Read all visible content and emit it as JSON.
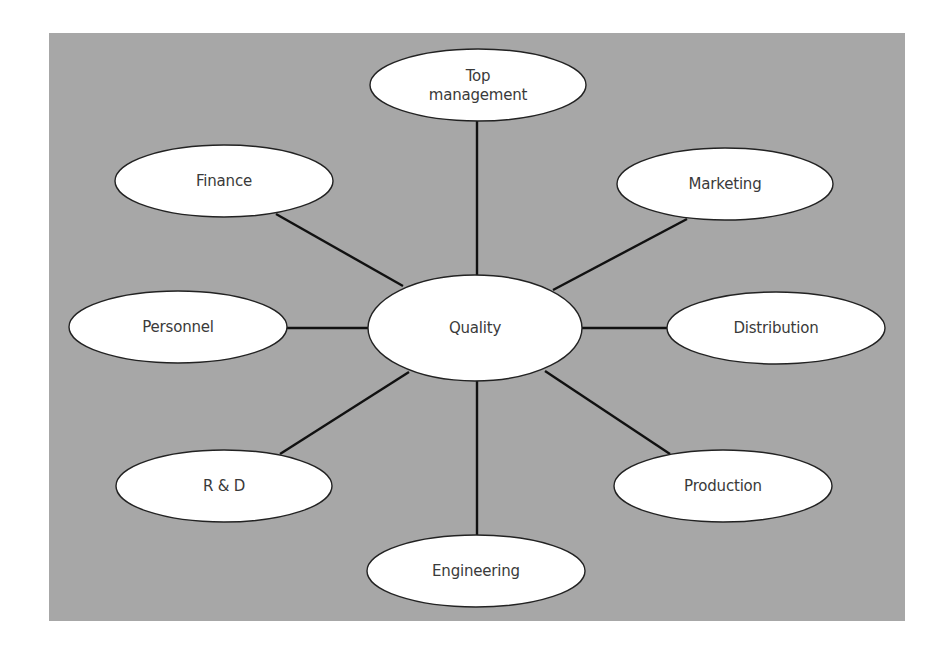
{
  "diagram": {
    "type": "hub-and-spoke",
    "background_color": "#a7a7a7",
    "node_fill": "#ffffff",
    "node_stroke": "#222222",
    "edge_color": "#111111",
    "center": {
      "id": "quality",
      "label": "Quality",
      "cx": 475,
      "cy": 328,
      "rx": 107,
      "ry": 53
    },
    "nodes": [
      {
        "id": "top-management",
        "label_line1": "Top",
        "label_line2": "management",
        "cx": 478,
        "cy": 85,
        "rx": 108,
        "ry": 36
      },
      {
        "id": "finance",
        "label_line1": "Finance",
        "label_line2": "",
        "cx": 224,
        "cy": 181,
        "rx": 109,
        "ry": 36
      },
      {
        "id": "marketing",
        "label_line1": "Marketing",
        "label_line2": "",
        "cx": 725,
        "cy": 184,
        "rx": 108,
        "ry": 36
      },
      {
        "id": "personnel",
        "label_line1": "Personnel",
        "label_line2": "",
        "cx": 178,
        "cy": 327,
        "rx": 109,
        "ry": 36
      },
      {
        "id": "distribution",
        "label_line1": "Distribution",
        "label_line2": "",
        "cx": 776,
        "cy": 328,
        "rx": 109,
        "ry": 36
      },
      {
        "id": "r-and-d",
        "label_line1": "R & D",
        "label_line2": "",
        "cx": 224,
        "cy": 486,
        "rx": 108,
        "ry": 36
      },
      {
        "id": "production",
        "label_line1": "Production",
        "label_line2": "",
        "cx": 723,
        "cy": 486,
        "rx": 109,
        "ry": 36
      },
      {
        "id": "engineering",
        "label_line1": "Engineering",
        "label_line2": "",
        "cx": 476,
        "cy": 571,
        "rx": 109,
        "ry": 36
      }
    ],
    "edges": [
      {
        "from": "quality",
        "to": "top-management",
        "x1": 477,
        "y1": 275,
        "x2": 477,
        "y2": 121
      },
      {
        "from": "quality",
        "to": "finance",
        "x1": 403,
        "y1": 286,
        "x2": 276,
        "y2": 214
      },
      {
        "from": "quality",
        "to": "marketing",
        "x1": 553,
        "y1": 290,
        "x2": 687,
        "y2": 219
      },
      {
        "from": "quality",
        "to": "personnel",
        "x1": 368,
        "y1": 328,
        "x2": 287,
        "y2": 328
      },
      {
        "from": "quality",
        "to": "distribution",
        "x1": 582,
        "y1": 328,
        "x2": 667,
        "y2": 328
      },
      {
        "from": "quality",
        "to": "r-and-d",
        "x1": 409,
        "y1": 372,
        "x2": 280,
        "y2": 454
      },
      {
        "from": "quality",
        "to": "production",
        "x1": 545,
        "y1": 371,
        "x2": 670,
        "y2": 454
      },
      {
        "from": "quality",
        "to": "engineering",
        "x1": 477,
        "y1": 381,
        "x2": 477,
        "y2": 535
      }
    ]
  }
}
